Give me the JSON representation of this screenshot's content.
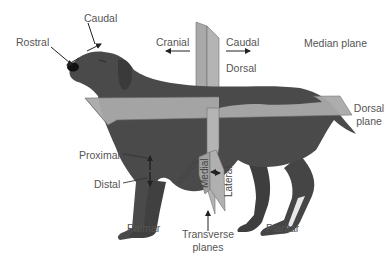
{
  "figure": {
    "colors": {
      "background": "#ffffff",
      "dog": "#4a4a4a",
      "dog_shadow": "#3a3a3a",
      "plane": "#a9a9a9",
      "plane_edge": "#6e6e6e",
      "text": "#555555",
      "arrow": "#222222"
    }
  },
  "labels": {
    "rostral": "Rostral",
    "caudal_head": "Caudal",
    "cranial": "Cranial",
    "caudal_body": "Caudal",
    "dorsal": "Dorsal",
    "median_plane": "Median plane",
    "dorsal_plane_line1": "Dorsal",
    "dorsal_plane_line2": "plane",
    "proximal": "Proximal",
    "distal": "Distal",
    "ventral": "Ventral",
    "medial": "Medial",
    "lateral": "Lateral",
    "palmar": "Palmar",
    "transverse_line1": "Transverse",
    "transverse_line2": "planes",
    "plantar": "Plantar"
  }
}
